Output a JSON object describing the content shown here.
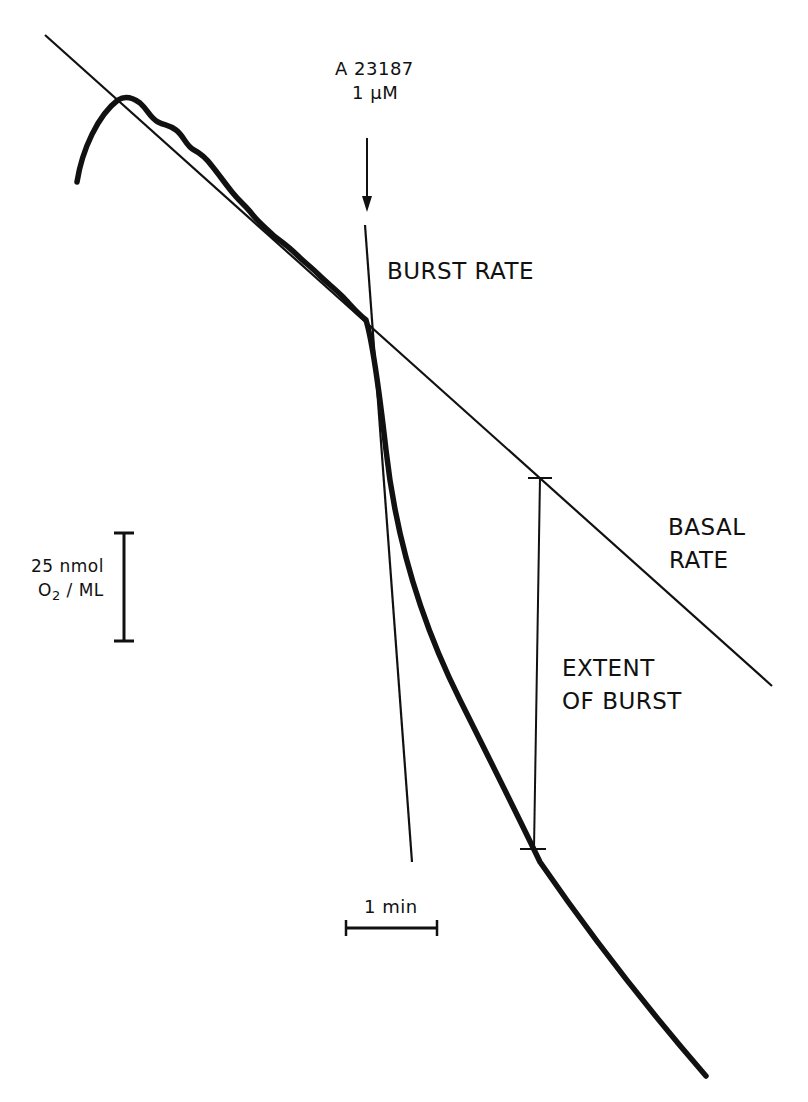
{
  "figure": {
    "type": "oxygen-consumption-trace",
    "stimulus": {
      "agent": "A 23187",
      "concentration": "1 μM"
    },
    "labels": {
      "burst_rate": "BURST RATE",
      "basal_rate_line1": "BASAL",
      "basal_rate_line2": "RATE",
      "extent_line1": "EXTENT",
      "extent_line2": "OF BURST"
    },
    "scale_bars": {
      "vertical_line1": "25 nmol",
      "vertical_line2_prefix": "O",
      "vertical_line2_sub": "2",
      "vertical_line2_suffix": " / ML",
      "horizontal": "1 min"
    },
    "colors": {
      "ink": "#111111",
      "background": "#ffffff"
    }
  }
}
